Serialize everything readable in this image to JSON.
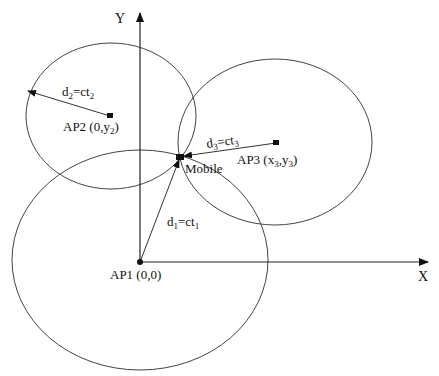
{
  "diagram": {
    "type": "trilateration",
    "axes": {
      "x_label": "X",
      "y_label": "Y"
    },
    "access_points": [
      {
        "id": "AP1",
        "label": "AP1 (0,0)",
        "distance_label_main": "d",
        "distance_sub": "1",
        "distance_eq": "=ct",
        "distance_sub2": "1"
      },
      {
        "id": "AP2",
        "label_main": "AP2 (0,y",
        "label_sub": "2",
        "label_end": ")",
        "distance_label_main": "d",
        "distance_sub": "2",
        "distance_eq": "=ct",
        "distance_sub2": "2"
      },
      {
        "id": "AP3",
        "label_main": "AP3 (x",
        "label_sub_a": "3",
        "label_mid": ",y",
        "label_sub_b": "3",
        "label_end": ")",
        "distance_label_main": "d",
        "distance_sub": "3",
        "distance_eq": "=ct",
        "distance_sub2": "3"
      }
    ],
    "mobile": {
      "label": "Mobile"
    },
    "colors": {
      "line": "#444444",
      "text": "#111111",
      "background": "#ffffff"
    }
  }
}
